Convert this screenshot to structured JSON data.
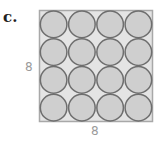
{
  "part_label": "c.",
  "figure": {
    "side_label_left": "8",
    "side_label_bottom": "8",
    "grid_rows": 4,
    "grid_cols": 4,
    "colors": {
      "square_fill": "#e4e4e4",
      "square_stroke": "#a8a8a8",
      "circle_fill": "#cfcfcf",
      "circle_stroke": "#6e6e6e"
    }
  }
}
